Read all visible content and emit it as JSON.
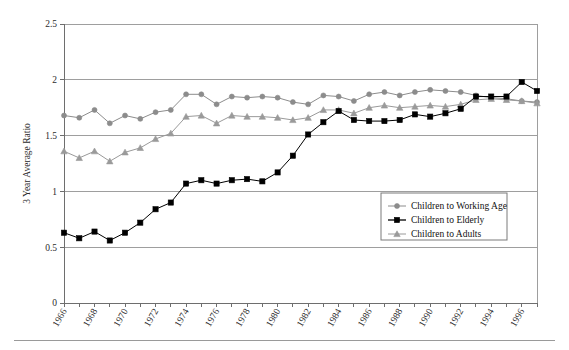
{
  "chart_data": {
    "type": "line",
    "title": "",
    "subtitle": "",
    "xlabel": "",
    "ylabel": "3 Year Average Ratio",
    "xlim": [
      1966,
      1997
    ],
    "ylim": [
      0,
      2.5
    ],
    "grid": "horizontal",
    "legend_position": "inside-right-middle",
    "x": [
      1966,
      1967,
      1968,
      1969,
      1970,
      1971,
      1972,
      1973,
      1974,
      1975,
      1976,
      1977,
      1978,
      1979,
      1980,
      1981,
      1982,
      1983,
      1984,
      1985,
      1986,
      1987,
      1988,
      1989,
      1990,
      1991,
      1992,
      1993,
      1994,
      1995,
      1996,
      1997
    ],
    "x_tick_labels": [
      "1966",
      "1968",
      "1970",
      "1972",
      "1974",
      "1976",
      "1978",
      "1980",
      "1982",
      "1984",
      "1986",
      "1988",
      "1990",
      "1992",
      "1994",
      "1996"
    ],
    "y_tick_labels": [
      "0",
      "0.5",
      "1",
      "1.5",
      "2",
      "2.5"
    ],
    "y_ticks": [
      0,
      0.5,
      1,
      1.5,
      2,
      2.5
    ],
    "series": [
      {
        "name": "Children to Working Age",
        "marker": "circle",
        "color": "#8c8c8c",
        "values": [
          1.68,
          1.66,
          1.73,
          1.61,
          1.68,
          1.65,
          1.71,
          1.73,
          1.87,
          1.87,
          1.78,
          1.85,
          1.84,
          1.85,
          1.84,
          1.8,
          1.78,
          1.86,
          1.85,
          1.81,
          1.87,
          1.89,
          1.86,
          1.89,
          1.91,
          1.9,
          1.89,
          1.86,
          1.84,
          1.83,
          1.81,
          1.8
        ]
      },
      {
        "name": "Children to Elderly",
        "marker": "square",
        "color": "#000000",
        "values": [
          0.63,
          0.58,
          0.64,
          0.56,
          0.63,
          0.72,
          0.84,
          0.9,
          1.07,
          1.1,
          1.07,
          1.1,
          1.11,
          1.09,
          1.17,
          1.32,
          1.51,
          1.62,
          1.72,
          1.64,
          1.63,
          1.63,
          1.64,
          1.69,
          1.67,
          1.7,
          1.74,
          1.85,
          1.85,
          1.85,
          1.98,
          1.9
        ]
      },
      {
        "name": "Children to Adults",
        "marker": "triangle",
        "color": "#9a9a9a",
        "values": [
          1.36,
          1.3,
          1.36,
          1.27,
          1.35,
          1.39,
          1.47,
          1.52,
          1.67,
          1.68,
          1.61,
          1.68,
          1.67,
          1.67,
          1.66,
          1.64,
          1.66,
          1.73,
          1.73,
          1.7,
          1.75,
          1.77,
          1.75,
          1.76,
          1.77,
          1.76,
          1.78,
          1.82,
          1.83,
          1.82,
          1.81,
          1.79
        ]
      }
    ]
  },
  "legend": {
    "items": [
      {
        "label": "Children to Working Age"
      },
      {
        "label": "Children to Elderly"
      },
      {
        "label": "Children to Adults"
      }
    ]
  },
  "colors": {
    "series_working_age": "#8c8c8c",
    "series_elderly": "#000000",
    "series_adults": "#9a9a9a",
    "gridline": "#9e9e9e",
    "axis": "#6e6e6e",
    "text": "#2b2b2b",
    "background": "#ffffff"
  }
}
